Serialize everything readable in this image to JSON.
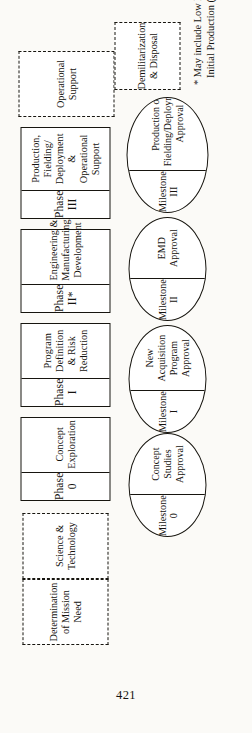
{
  "page": {
    "folio": "421"
  },
  "figure": {
    "footnote": "* May include Low Rate\nInitial Production (LRIP)",
    "pre_phase_boxes": [
      {
        "label": "Determination\nof Mission Need"
      },
      {
        "label": "Science &\nTechnology"
      }
    ],
    "phases": [
      {
        "head": "Phase 0",
        "body": "Concept\nExploration"
      },
      {
        "head": "Phase I",
        "body": "Program Definition\n& Risk Reduction"
      },
      {
        "head": "Phase II*",
        "body": "Engineering &\nManufacturing\nDevelopment"
      },
      {
        "head": "Phase III",
        "body": "Production, Fielding/\nDeployment &\nOperational\nSupport"
      }
    ],
    "post_phase_boxes": [
      {
        "label": "Operational\nSupport"
      },
      {
        "label": "Demilitarization\n& Disposal"
      }
    ],
    "milestones": [
      {
        "head": "Milestone 0",
        "body": "Concept Studies\nApproval"
      },
      {
        "head": "Milestone I",
        "body": "New Acquisition\nProgram Approval"
      },
      {
        "head": "Milestone II",
        "body": "EMD\nApproval"
      },
      {
        "head": "Milestone III",
        "body": "Production or\nFielding/Deployment\nApproval"
      }
    ]
  }
}
